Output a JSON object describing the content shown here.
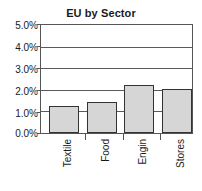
{
  "chart_data": {
    "type": "bar",
    "title": "EU by Sector",
    "xlabel": "",
    "ylabel": "",
    "categories": [
      "Textile",
      "Food",
      "Engin",
      "Stores"
    ],
    "values": [
      1.25,
      1.45,
      2.2,
      2.05
    ],
    "value_format": "percent",
    "ylim": [
      0.0,
      5.0
    ],
    "ytick_labels": [
      "5.0%",
      "4.0%",
      "3.0%",
      "2.0%",
      "1.0%",
      "0.0%"
    ],
    "ytick_values": [
      5.0,
      4.0,
      3.0,
      2.0,
      1.0,
      0.0
    ],
    "grid": true,
    "grid_axis": "y",
    "legend": false,
    "legend_position": "none",
    "series": [
      {
        "name": "EU by Sector",
        "values": [
          1.25,
          1.45,
          2.2,
          2.05
        ]
      }
    ],
    "colors": {
      "bar_fill": "#d6d6d6",
      "bar_border": "#333333",
      "grid": "#5a5a5a",
      "axis": "#555555",
      "text": "#1a1a1a",
      "background": "#ffffff"
    }
  }
}
